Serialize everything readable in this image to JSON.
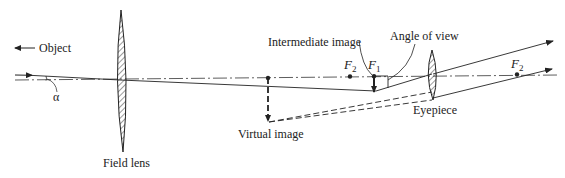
{
  "diagram": {
    "type": "optical-ray-diagram",
    "labels": {
      "object": "Object",
      "alpha": "α",
      "field_lens": "Field lens",
      "intermediate_image": "Intermediate image",
      "angle_of_view": "Angle of view",
      "virtual_image": "Virtual image",
      "eyepiece": "Eyepiece",
      "f2_left": "F",
      "f2_left_sub": "2",
      "f1": "F",
      "f1_sub": "1",
      "f2_right": "F",
      "f2_right_sub": "2"
    },
    "colors": {
      "ink": "#222222",
      "background": "#ffffff"
    }
  }
}
